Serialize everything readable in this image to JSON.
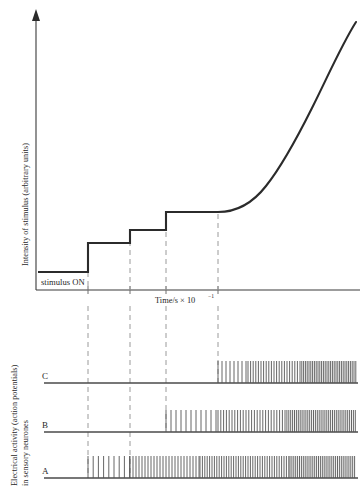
{
  "figure": {
    "title_visible": false,
    "background_color": "#ffffff",
    "ink_color": "#2b2b2b",
    "dash_color": "#9a9a9a"
  },
  "top_panel": {
    "y_axis_label": "Intensity of stimulus (arbitrary units)",
    "x_axis_label_prefix": "Time/s × 10",
    "x_axis_label_exponent": "−1",
    "x_axis_label_full": "Time/s × 10⁻¹",
    "stimulus_note": "stimulus  ON"
  },
  "bottom_panel": {
    "y_axis_label_line1": "Electrical activity (action potentials)",
    "y_axis_label_line2": "in sensory neurones",
    "traces": [
      {
        "label": "C",
        "baseline_y": 383,
        "onset_x": 218,
        "threshold_index": 3
      },
      {
        "label": "B",
        "baseline_y": 432,
        "onset_x": 166,
        "threshold_index": 2
      },
      {
        "label": "A",
        "baseline_y": 478,
        "onset_x": 88,
        "threshold_index": 0
      }
    ]
  },
  "chart_data": {
    "type": "line",
    "xlabel": "Time/s × 10⁻¹",
    "ylabel": "Intensity of stimulus (arbitrary units)",
    "xlim": [
      0,
      10
    ],
    "ylim": [
      0,
      10
    ],
    "grid": false,
    "legend": "none",
    "annotations": [
      "stimulus  ON"
    ],
    "event_times_x_px": [
      88,
      130,
      166,
      218
    ],
    "stimulus_step_profile": {
      "description": "Staircase of increasing stimulus intensity followed by a smooth exponential rise",
      "x_px": [
        38,
        88,
        88,
        130,
        130,
        166,
        166,
        218
      ],
      "y_px": [
        272,
        272,
        243,
        243,
        230,
        230,
        212,
        212
      ],
      "levels_arbitrary_units": [
        0.6,
        1.8,
        2.4,
        3.2
      ],
      "plateau_end_x_px": 218
    },
    "stimulus_smooth_rise": {
      "description": "Exponential-like increase after the final step",
      "x_px": [
        218,
        240,
        262,
        284,
        306,
        328,
        350,
        356
      ],
      "y_px": [
        212,
        206,
        190,
        163,
        129,
        92,
        46,
        24
      ]
    },
    "series": [
      {
        "name": "C",
        "type": "spike-train",
        "onset_x_px": 218,
        "end_x_px": 356,
        "segments": [
          {
            "from_x_px": 218,
            "to_x_px": 248,
            "spacing_px": 4.0,
            "height_px": 22
          },
          {
            "from_x_px": 248,
            "to_x_px": 300,
            "spacing_px": 2.6,
            "height_px": 22
          },
          {
            "from_x_px": 300,
            "to_x_px": 356,
            "spacing_px": 1.8,
            "height_px": 22
          }
        ]
      },
      {
        "name": "B",
        "type": "spike-train",
        "onset_x_px": 166,
        "end_x_px": 356,
        "segments": [
          {
            "from_x_px": 166,
            "to_x_px": 218,
            "spacing_px": 5.0,
            "height_px": 22
          },
          {
            "from_x_px": 218,
            "to_x_px": 285,
            "spacing_px": 2.8,
            "height_px": 22
          },
          {
            "from_x_px": 285,
            "to_x_px": 356,
            "spacing_px": 1.9,
            "height_px": 22
          }
        ]
      },
      {
        "name": "A",
        "type": "spike-train",
        "onset_x_px": 88,
        "end_x_px": 356,
        "segments": [
          {
            "from_x_px": 88,
            "to_x_px": 130,
            "spacing_px": 5.2,
            "height_px": 22
          },
          {
            "from_x_px": 130,
            "to_x_px": 200,
            "spacing_px": 3.0,
            "height_px": 22
          },
          {
            "from_x_px": 200,
            "to_x_px": 290,
            "spacing_px": 2.4,
            "height_px": 22
          },
          {
            "from_x_px": 290,
            "to_x_px": 356,
            "spacing_px": 1.9,
            "height_px": 22
          }
        ]
      }
    ]
  }
}
